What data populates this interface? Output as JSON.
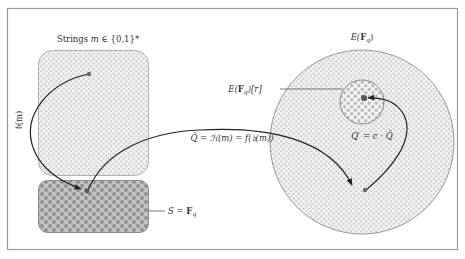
{
  "diagram": {
    "labels": {
      "strings": "Strings m ∈ {0,1}*",
      "strings_prefix": "Strings ",
      "strings_var": "m",
      "strings_set": " ∈ {0,1}*",
      "curve": "E(F_q)",
      "curve_E": "E(",
      "curve_F": "F",
      "curve_q": "q",
      "curve_close": ")",
      "subgroup": "E(F_q)[r]",
      "subgroup_E": "E(",
      "subgroup_F": "F",
      "subgroup_q": "q",
      "subgroup_close": ")[r]",
      "hash_map": "Q̂ = H(m) = f(h(m))",
      "hash_map_text": "Q̂ = ℋ(m) = f(𝔥(m))",
      "cofactor": "Q' = c·Q̂",
      "cofactor_text": "Q′ = c · Q̂",
      "field": "S = F_q",
      "field_S": "S = ",
      "field_F": "F",
      "field_q": "q",
      "h_of_m": "𝔥(m)"
    },
    "colors": {
      "frame": "#9a9a9a",
      "region_stroke": "#a0a0a0",
      "light_dot": "#c8c8c8",
      "dense_fill": "#bdbdbd",
      "dense_dot": "#8c8c8c",
      "arrow": "#222222",
      "point": "#555555",
      "leader_line": "#555555"
    }
  }
}
